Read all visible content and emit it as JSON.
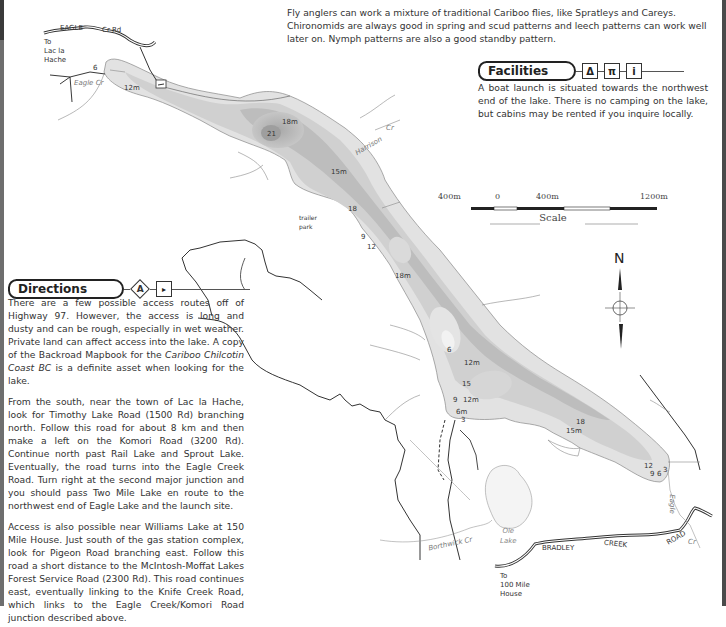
{
  "intro": {
    "text": "Fly anglers can work a mixture of traditional Cariboo flies, like Spratleys and Careys. Chironomids are always good in spring and scud patterns and leech patterns can work well later on. Nymph patterns are also a good standby pattern."
  },
  "facilities": {
    "title": "Facilities",
    "icons": [
      "campsite-icon",
      "picnic-table-icon",
      "info-icon"
    ],
    "icon_glyphs": [
      "Δ",
      "π",
      "i"
    ],
    "text": "A boat launch is situated towards the northwest end of the lake. There is no camping on the lake, but cabins may be rented if you inquire locally."
  },
  "directions": {
    "title": "Directions",
    "icons": [
      "access-a-icon",
      "boat-launch-icon"
    ],
    "icon_glyphs": [
      "A",
      "⛵"
    ],
    "paragraphs": [
      {
        "before": "There are a few possible access routes off of Highway 97. However, the access is long and dusty and can be rough, especially in wet weather. Private land can affect access into the lake. A copy of the Backroad Mapbook for the ",
        "italic": "Cariboo Chilcotin Coast BC",
        "after": " is a definite asset when looking for the lake."
      },
      {
        "text": "From the south, near the town of Lac la Hache, look for Timothy Lake Road (1500 Rd) branching north. Follow this road for about 8 km and then make a left on the Komori Road (3200 Rd). Continue north past Rail Lake and Sprout Lake. Eventually, the road turns into the Eagle Creek Road. Turn right at the second major junction and you should pass Two Mile Lake en route to the northwest end of Eagle Lake and the launch site."
      },
      {
        "text": "Access is also possible near Williams Lake at 150 Mile House. Just south of the gas station complex, look for Pigeon Road branching east. Follow this road a short distance to the McIntosh-Moffat Lakes Forest Service Road (2300 Rd). This road continues east, eventually linking to the Knife Creek Road, which links to the Eagle Creek/Komori Road junction described above."
      }
    ]
  },
  "scale": {
    "labels": [
      "400m",
      "0",
      "400m",
      "1200m"
    ],
    "title": "Scale"
  },
  "compass": {
    "label": "N"
  },
  "map_labels": {
    "eagle_road": "EAGLE",
    "cr_rd": "Cr Rd",
    "to_lac_la_hache": [
      "To",
      "Lac la",
      "Hache"
    ],
    "eagle_cr": "Eagle Cr",
    "harrison_cr": "Harrison",
    "harrison_cr2": "Cr",
    "trailer_park": [
      "trailer",
      "park"
    ],
    "ole_lake": [
      "Ole",
      "Lake"
    ],
    "borthwick_cr": "Borthwick Cr",
    "bradley": "BRADLEY",
    "creek": "CREEK",
    "road": "ROAD",
    "to_100_mile": [
      "To",
      "100 Mile",
      "House"
    ],
    "eagle_south": "Eagle",
    "cr_south": "Cr"
  },
  "depths": [
    {
      "v": "6",
      "x": 93,
      "y": 64
    },
    {
      "v": "12m",
      "x": 124,
      "y": 84
    },
    {
      "v": "18m",
      "x": 282,
      "y": 118
    },
    {
      "v": "21",
      "x": 267,
      "y": 130
    },
    {
      "v": "15m",
      "x": 331,
      "y": 168
    },
    {
      "v": "18",
      "x": 348,
      "y": 205
    },
    {
      "v": "9",
      "x": 361,
      "y": 233
    },
    {
      "v": "12",
      "x": 367,
      "y": 243
    },
    {
      "v": "18m",
      "x": 395,
      "y": 272
    },
    {
      "v": "6",
      "x": 447,
      "y": 346
    },
    {
      "v": "12m",
      "x": 464,
      "y": 359
    },
    {
      "v": "15",
      "x": 462,
      "y": 380
    },
    {
      "v": "9",
      "x": 453,
      "y": 396
    },
    {
      "v": "12m",
      "x": 463,
      "y": 396
    },
    {
      "v": "6m",
      "x": 456,
      "y": 408
    },
    {
      "v": "3",
      "x": 461,
      "y": 416
    },
    {
      "v": "18",
      "x": 576,
      "y": 418
    },
    {
      "v": "15m",
      "x": 566,
      "y": 427
    },
    {
      "v": "12",
      "x": 644,
      "y": 462
    },
    {
      "v": "9",
      "x": 650,
      "y": 470
    },
    {
      "v": "6",
      "x": 657,
      "y": 470
    },
    {
      "v": "3",
      "x": 663,
      "y": 466
    }
  ],
  "colors": {
    "lake_shallow": "#e4e4e4",
    "lake_mid": "#cfcfcf",
    "lake_deep": "#b4b4b4",
    "lake_deepest": "#9e9e9e",
    "road": "#333333",
    "creek": "#888888",
    "border": "#4a4a4a"
  }
}
